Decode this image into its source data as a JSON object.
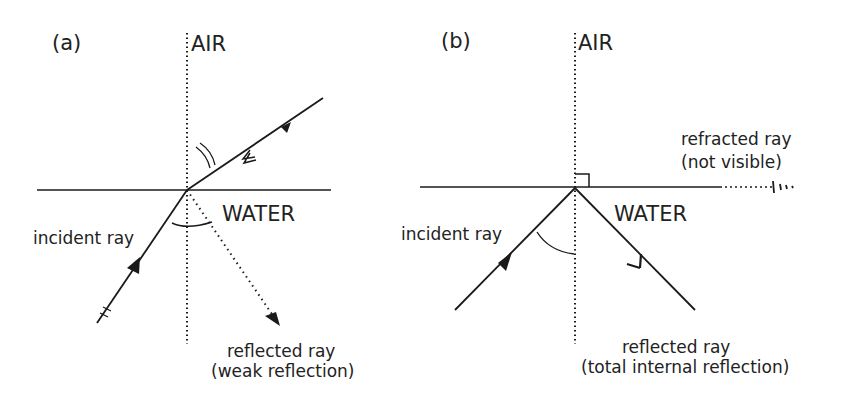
{
  "panels": [
    {
      "id": "a",
      "label": "(a)",
      "air_label": "AIR",
      "water_label": "WATER",
      "incident_label": "incident ray",
      "reflected_label_line1": "reflected ray",
      "reflected_label_line2": "(weak reflection)"
    },
    {
      "id": "b",
      "label": "(b)",
      "air_label": "AIR",
      "water_label": "WATER",
      "incident_label": "incident ray",
      "refracted_label_line1": "refracted ray",
      "refracted_label_line2": "(not visible)",
      "reflected_label_line1": "reflected ray",
      "reflected_label_line2": "(total internal reflection)"
    }
  ],
  "colors": {
    "line": "#1a1a1a",
    "text": "#222222",
    "background": "#ffffff"
  }
}
